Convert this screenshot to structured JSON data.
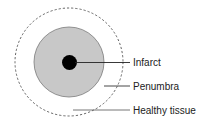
{
  "diagram": {
    "type": "concentric-zones",
    "colors": {
      "background": "#ffffff",
      "healthy_boundary": "#555555",
      "penumbra_fill": "#c8c8c8",
      "penumbra_stroke": "#7a7a7a",
      "infarct_fill": "#000000",
      "leader_line": "#333333"
    },
    "zones": [
      {
        "name": "infarct",
        "label": "Infarct",
        "style": "solid black core"
      },
      {
        "name": "penumbra",
        "label": "Penumbra",
        "style": "gray filled ring"
      },
      {
        "name": "healthy",
        "label": "Healthy tissue",
        "style": "dashed outer boundary"
      }
    ]
  }
}
